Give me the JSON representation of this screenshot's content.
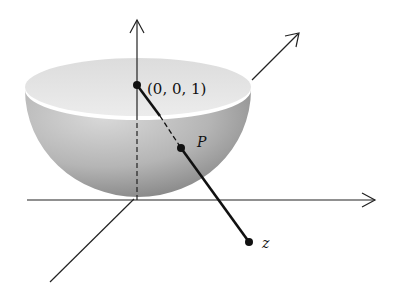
{
  "figure": {
    "labels": {
      "north_pole": "(0, 0, 1)",
      "point_on_sphere": "P",
      "point_in_plane": "z"
    },
    "colors": {
      "background": "#ffffff",
      "ink": "#111111",
      "sphere_top": "#e6e6e6",
      "sphere_side_light": "#d2d2d2",
      "sphere_side_dark": "#8c8c8c"
    }
  }
}
